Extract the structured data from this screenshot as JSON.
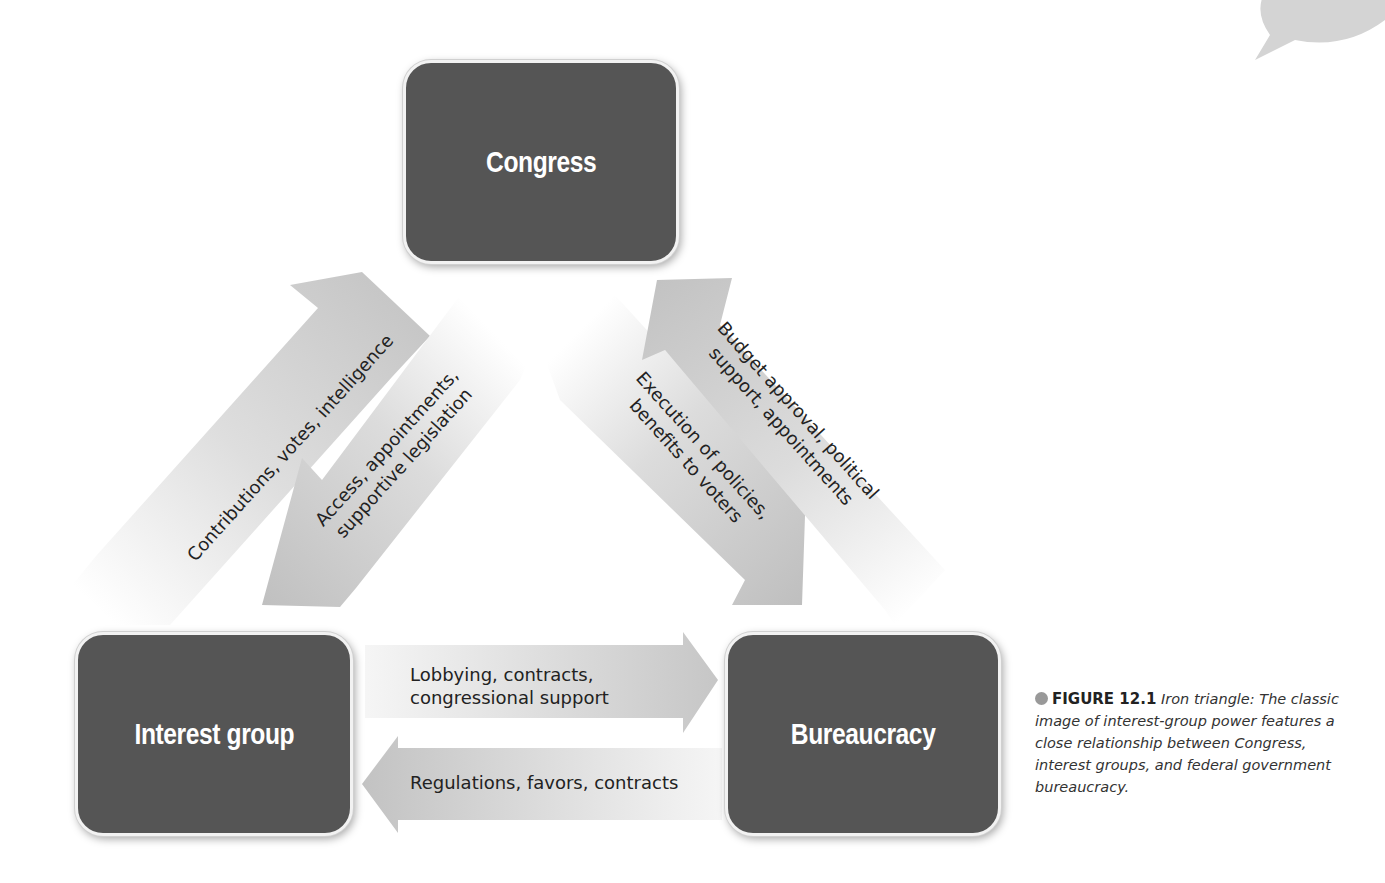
{
  "diagram": {
    "type": "iron-triangle",
    "nodes": {
      "congress": {
        "label": "Congress"
      },
      "interest_group": {
        "label": "Interest group"
      },
      "bureaucracy": {
        "label": "Bureaucracy"
      }
    },
    "edges": [
      {
        "id": "ig_to_congress",
        "from": "Interest group",
        "to": "Congress",
        "label": "Contributions, votes, intelligence"
      },
      {
        "id": "congress_to_ig",
        "from": "Congress",
        "to": "Interest group",
        "label_line1": "Access, appointments,",
        "label_line2": "supportive legislation"
      },
      {
        "id": "congress_to_bureau",
        "from": "Congress",
        "to": "Bureaucracy",
        "label_line1": "Execution of policies,",
        "label_line2": "benefits to voters"
      },
      {
        "id": "bureau_to_congress",
        "from": "Bureaucracy",
        "to": "Congress",
        "label_line1": "Budget approval, political",
        "label_line2": "support, appointments"
      },
      {
        "id": "ig_to_bureau",
        "from": "Interest group",
        "to": "Bureaucracy",
        "label_line1": "Lobbying, contracts,",
        "label_line2": "congressional support"
      },
      {
        "id": "bureau_to_ig",
        "from": "Bureaucracy",
        "to": "Interest group",
        "label": "Regulations, favors, contracts"
      }
    ]
  },
  "caption": {
    "figure_number": "FIGURE 12.1",
    "title": "Iron triangle:",
    "body": "The classic image of interest-group power features a close relationship between Congress, interest groups, and federal government bureaucracy."
  },
  "colors": {
    "node_fill": "#555555",
    "node_text": "#ffffff",
    "arrow_fill": "#c4c4c4",
    "caption_dot": "#999999"
  }
}
